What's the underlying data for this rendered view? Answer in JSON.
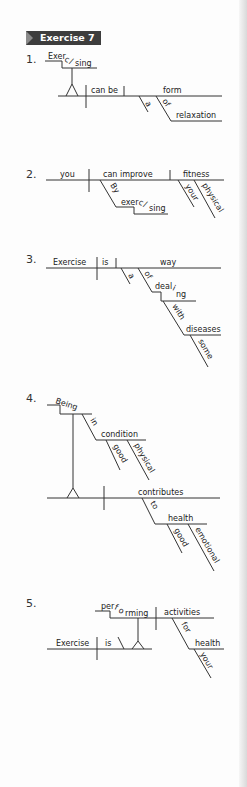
{
  "header": {
    "title": "Exercise 7"
  },
  "exercises": [
    {
      "number": "1.",
      "words": {
        "subject_gerund_a": "Exer",
        "subject_gerund_b": "c",
        "subject_gerund_c": "/",
        "subject_gerund_d": "sing",
        "verb": "can be",
        "complement": "form",
        "mod_a": "a",
        "mod_of": "of",
        "obj_of": "relaxation"
      }
    },
    {
      "number": "2.",
      "words": {
        "subject": "you",
        "verb": "can improve",
        "object": "fitness",
        "prep": "By",
        "gerund_a": "exer",
        "gerund_b": "c",
        "gerund_c": "/",
        "gerund_d": "sing",
        "mod_your": "your",
        "mod_physical": "physical"
      }
    },
    {
      "number": "3.",
      "words": {
        "subject": "Exercise",
        "verb": "is",
        "complement": "way",
        "mod_a": "a",
        "prep_of": "of",
        "gerund_a": "deal",
        "gerund_b": "i",
        "gerund_c": "ng",
        "prep_with": "with",
        "obj_with": "diseases",
        "mod_some": "some"
      }
    },
    {
      "number": "4.",
      "words": {
        "gerund": "Being",
        "prep_in": "in",
        "obj_in": "condition",
        "mod_good": "good",
        "mod_physical": "physical",
        "verb": "contributes",
        "prep_to": "to",
        "obj_to": "health",
        "mod_good2": "good",
        "mod_emotional": "emotional"
      }
    },
    {
      "number": "5.",
      "words": {
        "gerund_a": "per",
        "gerund_b": "f",
        "gerund_c": "o",
        "gerund_d": "rming",
        "object": "activities",
        "prep_for": "for",
        "obj_for": "health",
        "mod_your": "your",
        "subject": "Exercise",
        "verb": "is"
      }
    }
  ]
}
